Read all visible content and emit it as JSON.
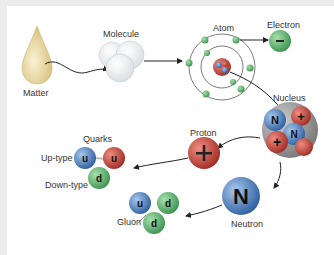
{
  "labels": {
    "matter": "Matter",
    "molecule": "Molecule",
    "atom": "Atom",
    "electron": "Electron",
    "nucleus": "Nucleus",
    "proton": "Proton",
    "neutron": "Neutron",
    "quarks": "Quarks",
    "up_type": "Up-type",
    "down_type": "Down-type",
    "gluon": "Gluon"
  },
  "symbols": {
    "electron": "−",
    "proton": "+",
    "neutron": "N",
    "up": "u",
    "down": "d"
  },
  "colors": {
    "matter_drop": "#e9d9a6",
    "electron": "#5db870",
    "proton": "#c9453b",
    "neutron": "#4f7fc0",
    "up_quark_1": "#5a8bc4",
    "up_quark_2": "#c0443c",
    "down_quark": "#6fb35d",
    "frame": "#ececec"
  }
}
